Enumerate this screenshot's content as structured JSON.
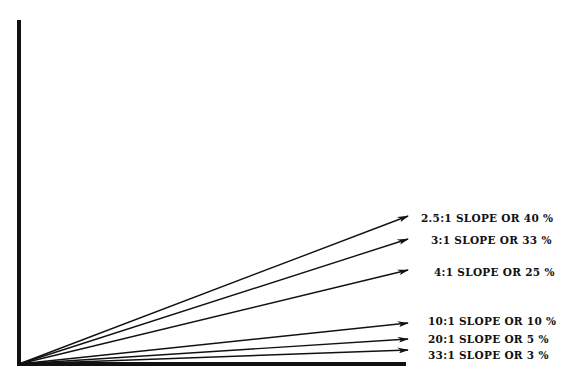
{
  "diagram": {
    "type": "slope-ratio-diagram",
    "origin": {
      "x": 19,
      "y": 364
    },
    "axes": {
      "vertical": {
        "x": 19,
        "y_top": 20,
        "y_bottom": 366
      },
      "horizontal": {
        "y": 364,
        "x_left": 17,
        "x_right": 406
      }
    },
    "colors": {
      "line": "#111111",
      "background": "#ffffff"
    },
    "slopes": [
      {
        "ratio": "2.5:1",
        "percent": "40 %",
        "label": "2.5:1 SLOPE OR 40 %",
        "end": {
          "x": 408,
          "y": 216
        },
        "label_pos": {
          "x": 421,
          "y": 212
        }
      },
      {
        "ratio": "3:1",
        "percent": "33 %",
        "label": "3:1 SLOPE OR 33 %",
        "end": {
          "x": 408,
          "y": 239
        },
        "label_pos": {
          "x": 431,
          "y": 234
        }
      },
      {
        "ratio": "4:1",
        "percent": "25 %",
        "label": "4:1 SLOPE OR 25 %",
        "end": {
          "x": 408,
          "y": 270
        },
        "label_pos": {
          "x": 434,
          "y": 266
        }
      },
      {
        "ratio": "10:1",
        "percent": "10 %",
        "label": "10:1 SLOPE OR 10 %",
        "end": {
          "x": 408,
          "y": 323
        },
        "label_pos": {
          "x": 428,
          "y": 315
        }
      },
      {
        "ratio": "20:1",
        "percent": "5 %",
        "label": "20:1 SLOPE OR 5 %",
        "end": {
          "x": 408,
          "y": 339
        },
        "label_pos": {
          "x": 428,
          "y": 333
        }
      },
      {
        "ratio": "33:1",
        "percent": "3 %",
        "label": "33:1 SLOPE OR 3 %",
        "end": {
          "x": 408,
          "y": 350
        },
        "label_pos": {
          "x": 428,
          "y": 349
        }
      }
    ]
  }
}
